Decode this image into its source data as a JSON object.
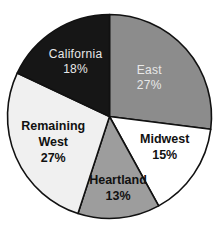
{
  "chart_data": {
    "type": "pie",
    "title": "",
    "title_visible": "cropped at top edge; text not legible",
    "start_angle": "12 o'clock",
    "direction": "clockwise",
    "slices": [
      {
        "label": "East",
        "value": 27,
        "display": "27%",
        "color": "#8c8c8c",
        "label_style": "light"
      },
      {
        "label": "Midwest",
        "value": 15,
        "display": "15%",
        "color": "#ffffff",
        "label_style": "dark"
      },
      {
        "label": "Heartland",
        "value": 13,
        "display": "13%",
        "color": "#9d9d9d",
        "label_style": "dark"
      },
      {
        "label": "Remaining West",
        "label_lines": [
          "Remaining",
          "West"
        ],
        "value": 27,
        "display": "27%",
        "color": "#f0f0f0",
        "label_style": "dark"
      },
      {
        "label": "California",
        "value": 18,
        "display": "18%",
        "color": "#161616",
        "label_style": "light"
      }
    ],
    "units": "percent",
    "legend": "none (labels inside slices)"
  }
}
